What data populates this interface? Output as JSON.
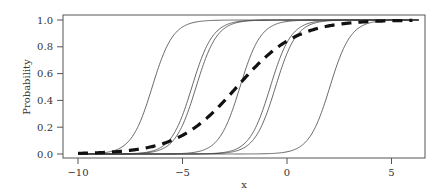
{
  "chart_data": {
    "type": "line",
    "title": "",
    "xlabel": "x",
    "ylabel": "Probability",
    "xlim": [
      -10.7,
      6.6
    ],
    "ylim": [
      -0.03,
      1.04
    ],
    "x_ticks": [
      -10,
      -5,
      0,
      5
    ],
    "x_tick_labels": [
      "−10",
      "−5",
      "0",
      "5"
    ],
    "y_ticks": [
      0.0,
      0.2,
      0.4,
      0.6,
      0.8,
      1.0
    ],
    "y_tick_labels": [
      "0.0",
      "0.2",
      "0.4",
      "0.6",
      "0.8",
      "1.0"
    ],
    "grid": false,
    "legend": null,
    "x": [
      -10,
      -9,
      -8,
      -7,
      -6,
      -5,
      -4,
      -3,
      -2,
      -1,
      0,
      1,
      2,
      3,
      4,
      5,
      6
    ],
    "series": [
      {
        "name": "curve-1",
        "style": "solid",
        "midpoint": -6.45,
        "slope": 2.0,
        "values": [
          0.0,
          0.001,
          0.045,
          0.25,
          0.711,
          0.948,
          0.993,
          0.999,
          1.0,
          1.0,
          1.0,
          1.0,
          1.0,
          1.0,
          1.0,
          1.0,
          1.0
        ]
      },
      {
        "name": "curve-2",
        "style": "solid",
        "midpoint": -4.55,
        "slope": 2.0,
        "values": [
          0.0,
          0.0,
          0.0,
          0.007,
          0.052,
          0.289,
          0.75,
          0.957,
          0.994,
          0.999,
          1.0,
          1.0,
          1.0,
          1.0,
          1.0,
          1.0,
          1.0
        ]
      },
      {
        "name": "curve-3",
        "style": "solid",
        "midpoint": -4.35,
        "slope": 2.0,
        "values": [
          0.0,
          0.0,
          0.0,
          0.005,
          0.036,
          0.214,
          0.668,
          0.937,
          0.991,
          0.999,
          1.0,
          1.0,
          1.0,
          1.0,
          1.0,
          1.0,
          1.0
        ]
      },
      {
        "name": "curve-4",
        "style": "solid",
        "midpoint": -2.25,
        "slope": 2.0,
        "values": [
          0.0,
          0.0,
          0.0,
          0.0,
          0.001,
          0.004,
          0.029,
          0.182,
          0.622,
          0.924,
          0.989,
          0.999,
          1.0,
          1.0,
          1.0,
          1.0,
          1.0
        ]
      },
      {
        "name": "curve-5",
        "style": "solid",
        "midpoint": -0.8,
        "slope": 2.0,
        "values": [
          0.0,
          0.0,
          0.0,
          0.0,
          0.0,
          0.0,
          0.002,
          0.012,
          0.083,
          0.401,
          0.832,
          0.973,
          0.996,
          1.0,
          1.0,
          1.0,
          1.0
        ]
      },
      {
        "name": "curve-6",
        "style": "solid",
        "midpoint": -0.55,
        "slope": 2.0,
        "values": [
          0.0,
          0.0,
          0.0,
          0.0,
          0.0,
          0.0,
          0.001,
          0.007,
          0.052,
          0.289,
          0.75,
          0.957,
          0.994,
          0.999,
          1.0,
          1.0,
          1.0
        ]
      },
      {
        "name": "curve-7",
        "style": "solid",
        "midpoint": 2.05,
        "slope": 2.0,
        "values": [
          0.0,
          0.0,
          0.0,
          0.0,
          0.0,
          0.0,
          0.0,
          0.0,
          0.0,
          0.002,
          0.016,
          0.109,
          0.475,
          0.87,
          0.98,
          0.997,
          1.0
        ]
      },
      {
        "name": "overall",
        "style": "dashed",
        "midpoint": -2.4,
        "slope": 0.7,
        "values": [
          0.005,
          0.01,
          0.02,
          0.04,
          0.074,
          0.135,
          0.246,
          0.398,
          0.57,
          0.727,
          0.843,
          0.915,
          0.956,
          0.977,
          0.988,
          0.994,
          0.997
        ]
      }
    ]
  }
}
